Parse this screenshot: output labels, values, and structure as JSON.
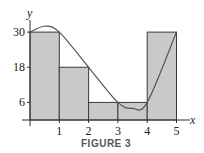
{
  "figure": {
    "caption": "FIGURE 3",
    "x_axis_label": "x",
    "y_axis_label": "y"
  },
  "colors": {
    "bar_fill": "#c9c9c9",
    "bar_stroke": "#3a3a3a",
    "curve": "#555555",
    "axis": "#333333"
  },
  "chart_data": {
    "type": "bar",
    "title": "FIGURE 3",
    "xlabel": "x",
    "ylabel": "y",
    "x_ticks": [
      "1",
      "2",
      "3",
      "4",
      "5"
    ],
    "y_ticks": [
      "6",
      "18",
      "30"
    ],
    "xlim": [
      0,
      5
    ],
    "ylim": [
      0,
      33
    ],
    "grid": false,
    "rectangles": [
      {
        "x_start": 0,
        "x_end": 1,
        "height": 30
      },
      {
        "x_start": 1,
        "x_end": 2,
        "height": 18
      },
      {
        "x_start": 2,
        "x_end": 3,
        "height": 6
      },
      {
        "x_start": 3,
        "x_end": 4,
        "height": 6
      },
      {
        "x_start": 4,
        "x_end": 5,
        "height": 30
      }
    ],
    "categories": [
      "[0,1]",
      "[1,2]",
      "[2,3]",
      "[3,4]",
      "[4,5]"
    ],
    "values": [
      30,
      18,
      6,
      6,
      30
    ],
    "curve": {
      "description": "smooth curve f(x) passing through rectangle corners",
      "points": [
        {
          "x": 0,
          "y": 30
        },
        {
          "x": 0.5,
          "y": 32
        },
        {
          "x": 1,
          "y": 30
        },
        {
          "x": 2,
          "y": 18
        },
        {
          "x": 3,
          "y": 6
        },
        {
          "x": 3.5,
          "y": 4
        },
        {
          "x": 4,
          "y": 6
        },
        {
          "x": 5,
          "y": 30
        }
      ]
    }
  }
}
